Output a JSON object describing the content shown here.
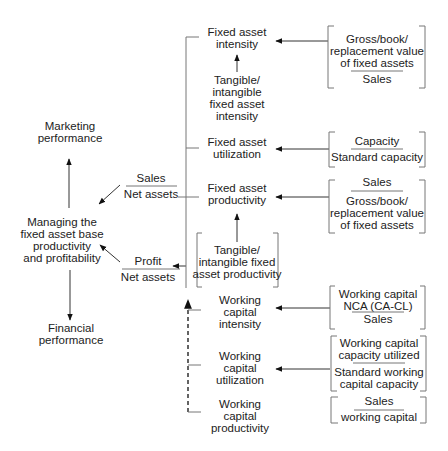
{
  "left": {
    "marketing": [
      "Marketing",
      "performance"
    ],
    "center": [
      "Managing the",
      "fixed asset base",
      "productivity",
      "and profitability"
    ],
    "financial": [
      "Financial",
      "performance"
    ]
  },
  "ratios": {
    "sales_net_assets": {
      "numerator": "Sales",
      "denominator": "Net assets"
    },
    "profit_net_assets": {
      "numerator": "Profit",
      "denominator": "Net assets"
    }
  },
  "middle": {
    "fixed_asset_intensity": [
      "Fixed asset",
      "intensity"
    ],
    "tangible_intensity": [
      "Tangible/",
      "intangible",
      "fixed asset",
      "intensity"
    ],
    "fixed_asset_utilization": [
      "Fixed asset",
      "utilization"
    ],
    "fixed_asset_productivity": [
      "Fixed asset",
      "productivity"
    ],
    "tangible_productivity": [
      "Tangible/",
      "intangible fixed",
      "asset productivity"
    ],
    "wc_intensity": [
      "Working",
      "capital",
      "intensity"
    ],
    "wc_utilization": [
      "Working",
      "capital",
      "utilization"
    ],
    "wc_productivity": [
      "Working",
      "capital",
      "productivity"
    ]
  },
  "right": {
    "fa_intensity_formula": {
      "numerator": [
        "Gross/book/",
        "replacement value",
        "of fixed assets"
      ],
      "denominator": [
        "Sales"
      ]
    },
    "fa_utilization_formula": {
      "numerator": [
        "Capacity"
      ],
      "denominator": [
        "Standard capacity"
      ]
    },
    "fa_productivity_formula": {
      "numerator": [
        "Sales"
      ],
      "denominator": [
        "Gross/book/",
        "replacement value",
        "of fixed assets"
      ]
    },
    "wc_intensity_formula": {
      "numerator": [
        "Working capital",
        "NCA (CA-CL)"
      ],
      "denominator": [
        "Sales"
      ]
    },
    "wc_utilization_formula": {
      "numerator": [
        "Working capital",
        "capacity utilized"
      ],
      "denominator": [
        "Standard working",
        "capital capacity"
      ]
    },
    "wc_productivity_formula": {
      "numerator": [
        "Sales"
      ],
      "denominator": [
        "working capital"
      ]
    }
  }
}
